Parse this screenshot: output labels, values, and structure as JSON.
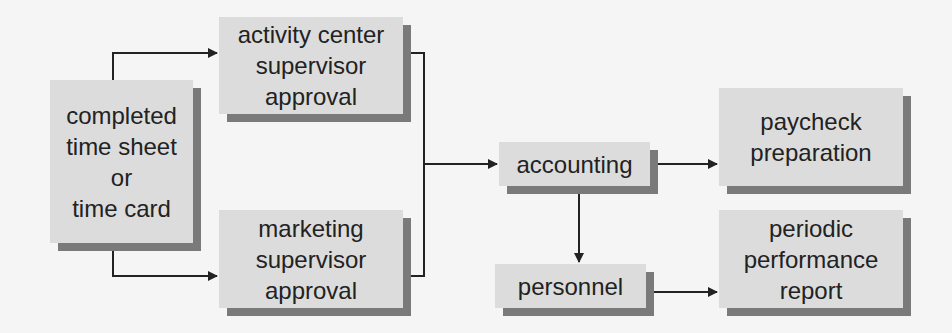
{
  "diagram": {
    "type": "flowchart",
    "colors": {
      "background": "#f5f5f5",
      "box_fill": "#dcdcdc",
      "box_shadow": "#7a7a7a",
      "line": "#222222",
      "text": "#222222"
    },
    "nodes": [
      {
        "id": "timesheet",
        "label": "completed\ntime sheet\nor\ntime card"
      },
      {
        "id": "activity",
        "label": "activity center\nsupervisor\napproval"
      },
      {
        "id": "marketing",
        "label": "marketing\nsupervisor\napproval"
      },
      {
        "id": "accounting",
        "label": "accounting"
      },
      {
        "id": "personnel",
        "label": "personnel"
      },
      {
        "id": "paycheck",
        "label": "paycheck\npreparation"
      },
      {
        "id": "periodic",
        "label": "periodic\nperformance\nreport"
      }
    ],
    "edges": [
      {
        "from": "timesheet",
        "to": "activity"
      },
      {
        "from": "timesheet",
        "to": "marketing"
      },
      {
        "from": "activity",
        "to": "accounting"
      },
      {
        "from": "marketing",
        "to": "accounting"
      },
      {
        "from": "accounting",
        "to": "paycheck"
      },
      {
        "from": "accounting",
        "to": "personnel"
      },
      {
        "from": "personnel",
        "to": "periodic"
      }
    ]
  }
}
